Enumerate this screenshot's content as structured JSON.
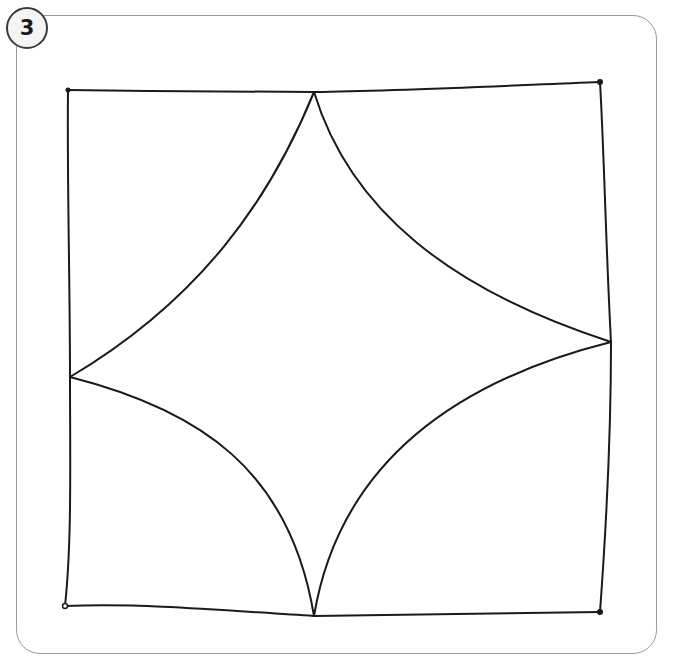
{
  "step": {
    "number": "3"
  },
  "figure": {
    "stroke_color": "#1a1a1a",
    "panel_border_color": "#9a9a9a",
    "badge_fill": "#f4f4f4",
    "square_corners": {
      "top_left": [
        68,
        90
      ],
      "top_right": [
        600,
        82
      ],
      "bottom_right": [
        600,
        612
      ],
      "bottom_left": [
        65,
        606
      ]
    },
    "side_midpoints": {
      "top": [
        314,
        92
      ],
      "right": [
        611,
        342
      ],
      "bottom": [
        314,
        616
      ],
      "left": [
        70,
        377
      ]
    }
  }
}
